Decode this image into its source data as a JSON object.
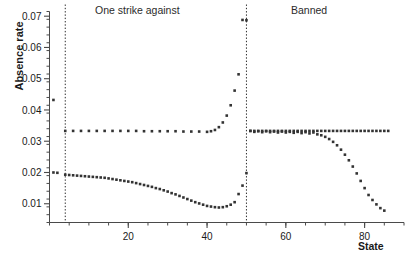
{
  "chart_data": {
    "type": "scatter",
    "title": "",
    "xlabel": "State",
    "ylabel": "Absence rate",
    "xlim": [
      0,
      90
    ],
    "ylim": [
      0.004,
      0.0715
    ],
    "grid": false,
    "legend": false,
    "y_ticks": [
      0.01,
      0.02,
      0.03,
      0.04,
      0.05,
      0.06,
      0.07
    ],
    "y_tick_labels": [
      "0.01",
      "0.02",
      "0.03",
      "0.04",
      "0.05",
      "0.06",
      "0.07"
    ],
    "y_minor_tick_step": 0.0025,
    "x_ticks": [
      20,
      40,
      60,
      80
    ],
    "x_tick_labels": [
      "20",
      "40",
      "60",
      "80"
    ],
    "x_minor_tick_step": 5,
    "annotations": [
      {
        "text": "One strike against",
        "x": 27,
        "y": 0.0705
      },
      {
        "text": "Banned",
        "x": 68,
        "y": 0.0705
      }
    ],
    "vlines": [
      {
        "x": 4,
        "style": "dotted"
      },
      {
        "x": 50,
        "style": "dotted"
      }
    ],
    "marker": {
      "shape": "square",
      "size": 2.6,
      "color": "#333333"
    },
    "series": [
      {
        "name": "upper",
        "color": "#333333",
        "points": [
          [
            1,
            0.0432
          ],
          [
            4,
            0.0333
          ],
          [
            6,
            0.0333
          ],
          [
            8,
            0.0333
          ],
          [
            10,
            0.0333
          ],
          [
            12,
            0.0333
          ],
          [
            14,
            0.0333
          ],
          [
            16,
            0.0333
          ],
          [
            18,
            0.0333
          ],
          [
            20,
            0.0333
          ],
          [
            22,
            0.0333
          ],
          [
            24,
            0.0332
          ],
          [
            26,
            0.0332
          ],
          [
            28,
            0.0332
          ],
          [
            30,
            0.0332
          ],
          [
            32,
            0.0332
          ],
          [
            34,
            0.0331
          ],
          [
            36,
            0.0331
          ],
          [
            38,
            0.0331
          ],
          [
            40,
            0.033
          ],
          [
            41,
            0.0332
          ],
          [
            42,
            0.0336
          ],
          [
            43,
            0.0345
          ],
          [
            44,
            0.036
          ],
          [
            45,
            0.0382
          ],
          [
            46,
            0.0415
          ],
          [
            47,
            0.0462
          ],
          [
            48,
            0.0514
          ],
          [
            49,
            0.0688
          ],
          [
            50,
            0.0687
          ],
          [
            51,
            0.0333
          ],
          [
            52,
            0.0333
          ],
          [
            53,
            0.0333
          ],
          [
            54,
            0.0333
          ],
          [
            55,
            0.0333
          ],
          [
            56,
            0.0333
          ],
          [
            57,
            0.0333
          ],
          [
            58,
            0.0333
          ],
          [
            59,
            0.0333
          ],
          [
            60,
            0.0333
          ],
          [
            61,
            0.0333
          ],
          [
            62,
            0.0333
          ],
          [
            63,
            0.0333
          ],
          [
            64,
            0.0333
          ],
          [
            65,
            0.0333
          ],
          [
            66,
            0.0333
          ],
          [
            67,
            0.0333
          ],
          [
            68,
            0.0333
          ],
          [
            69,
            0.0333
          ],
          [
            70,
            0.0333
          ],
          [
            71,
            0.0333
          ],
          [
            72,
            0.0333
          ],
          [
            73,
            0.0333
          ],
          [
            74,
            0.0333
          ],
          [
            75,
            0.0333
          ],
          [
            76,
            0.0333
          ],
          [
            77,
            0.0333
          ],
          [
            78,
            0.0333
          ],
          [
            79,
            0.0333
          ],
          [
            80,
            0.0333
          ],
          [
            81,
            0.0333
          ],
          [
            82,
            0.0333
          ],
          [
            83,
            0.0333
          ],
          [
            84,
            0.0333
          ],
          [
            85,
            0.0333
          ],
          [
            86,
            0.0333
          ]
        ]
      },
      {
        "name": "lower",
        "color": "#333333",
        "points": [
          [
            1,
            0.02
          ],
          [
            2,
            0.0199
          ],
          [
            4,
            0.0193
          ],
          [
            5,
            0.0192
          ],
          [
            6,
            0.0191
          ],
          [
            7,
            0.019
          ],
          [
            8,
            0.0189
          ],
          [
            9,
            0.0188
          ],
          [
            10,
            0.0187
          ],
          [
            11,
            0.0186
          ],
          [
            12,
            0.0185
          ],
          [
            13,
            0.0184
          ],
          [
            14,
            0.0183
          ],
          [
            15,
            0.0181
          ],
          [
            16,
            0.0179
          ],
          [
            17,
            0.0177
          ],
          [
            18,
            0.0175
          ],
          [
            19,
            0.0173
          ],
          [
            20,
            0.0171
          ],
          [
            21,
            0.0169
          ],
          [
            22,
            0.0166
          ],
          [
            23,
            0.0163
          ],
          [
            24,
            0.016
          ],
          [
            25,
            0.0157
          ],
          [
            26,
            0.0154
          ],
          [
            27,
            0.015
          ],
          [
            28,
            0.0147
          ],
          [
            29,
            0.0143
          ],
          [
            30,
            0.0139
          ],
          [
            31,
            0.0134
          ],
          [
            32,
            0.013
          ],
          [
            33,
            0.0125
          ],
          [
            34,
            0.012
          ],
          [
            35,
            0.0115
          ],
          [
            36,
            0.011
          ],
          [
            37,
            0.0105
          ],
          [
            38,
            0.0101
          ],
          [
            39,
            0.0097
          ],
          [
            40,
            0.0093
          ],
          [
            41,
            0.0091
          ],
          [
            42,
            0.0089
          ],
          [
            43,
            0.0088
          ],
          [
            44,
            0.0089
          ],
          [
            45,
            0.0092
          ],
          [
            46,
            0.0097
          ],
          [
            47,
            0.0105
          ],
          [
            48,
            0.0131
          ],
          [
            49,
            0.0158
          ],
          [
            50,
            0.0198
          ],
          [
            51,
            0.0333
          ],
          [
            52,
            0.033
          ],
          [
            53,
            0.0332
          ],
          [
            54,
            0.0329
          ],
          [
            55,
            0.0332
          ],
          [
            56,
            0.0329
          ],
          [
            57,
            0.0331
          ],
          [
            58,
            0.0328
          ],
          [
            59,
            0.0331
          ],
          [
            60,
            0.0328
          ],
          [
            61,
            0.033
          ],
          [
            62,
            0.0327
          ],
          [
            63,
            0.033
          ],
          [
            64,
            0.0326
          ],
          [
            65,
            0.0329
          ],
          [
            66,
            0.0325
          ],
          [
            67,
            0.0328
          ],
          [
            68,
            0.0322
          ],
          [
            69,
            0.0319
          ],
          [
            70,
            0.0314
          ],
          [
            71,
            0.0307
          ],
          [
            72,
            0.0298
          ],
          [
            73,
            0.0287
          ],
          [
            74,
            0.0273
          ],
          [
            75,
            0.0257
          ],
          [
            76,
            0.0239
          ],
          [
            77,
            0.0219
          ],
          [
            78,
            0.0197
          ],
          [
            79,
            0.0173
          ],
          [
            80,
            0.015
          ],
          [
            81,
            0.0128
          ],
          [
            82,
            0.0112
          ],
          [
            83,
            0.0098
          ],
          [
            84,
            0.0086
          ],
          [
            85,
            0.0078
          ]
        ]
      }
    ]
  }
}
